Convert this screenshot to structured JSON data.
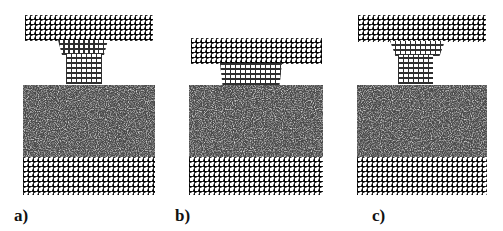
{
  "figure": {
    "panels": [
      {
        "id": "a",
        "label": "a)",
        "description": "Crystalline tip attached to upper slab, fully separated above amorphous liquid layer"
      },
      {
        "id": "b",
        "label": "b)",
        "description": "Upper slab lowered; short tip in contact with liquid surface"
      },
      {
        "id": "c",
        "label": "c)",
        "description": "Upper slab raised; tip re-formed and separated above liquid layer"
      }
    ],
    "colors": {
      "background": "#ffffff",
      "lattice": "#2f2f2f",
      "liquid": "#555555",
      "label": "#111111"
    }
  }
}
